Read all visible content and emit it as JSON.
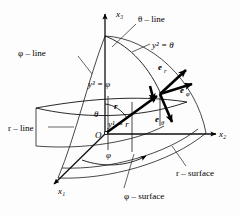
{
  "figure": {
    "name": "spherical-coordinate-system",
    "background_color": "#fdfdfd",
    "line_color": "#111111",
    "width": 240,
    "height": 215
  },
  "axes": [
    {
      "id": "x3",
      "label": "x₃",
      "direction": "up"
    },
    {
      "id": "x2",
      "label": "x₂",
      "direction": "right"
    },
    {
      "id": "x1",
      "label": "x₁",
      "direction": "lower-left"
    }
  ],
  "origin": {
    "label": "O"
  },
  "coordinate_labels": [
    {
      "id": "y1",
      "label": "y¹ = r"
    },
    {
      "id": "y2",
      "label": "y² = θ"
    },
    {
      "id": "y3",
      "label": "y³ = φ"
    }
  ],
  "basis_vectors": [
    {
      "id": "e_r",
      "base": "e",
      "sub": "r",
      "direction": "upper-right"
    },
    {
      "id": "e_phi",
      "base": "e",
      "sub": "φ",
      "direction": "right"
    },
    {
      "id": "e_theta",
      "base": "e",
      "sub": "θ",
      "direction": "down"
    }
  ],
  "position_vector": {
    "id": "r-vector",
    "label": "r"
  },
  "angles": [
    {
      "id": "theta-angle",
      "label": "θ"
    },
    {
      "id": "phi-angle",
      "label": "φ"
    }
  ],
  "callouts": [
    {
      "id": "theta-line",
      "label": "θ – line"
    },
    {
      "id": "phi-line",
      "label": "φ – line"
    },
    {
      "id": "r-line",
      "label": "r – line"
    },
    {
      "id": "r-surface",
      "label": "r – surface"
    },
    {
      "id": "phi-surface",
      "label": "φ – surface"
    }
  ]
}
